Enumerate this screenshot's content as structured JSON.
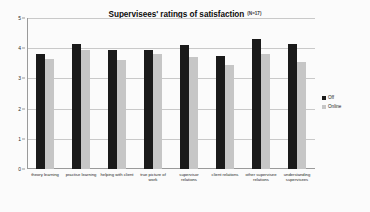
{
  "chart_data": {
    "type": "bar",
    "title": "Supervisees' ratings of satisfaction",
    "title_note": "(N=17)",
    "xlabel": "",
    "ylabel": "",
    "ylim": [
      0,
      5
    ],
    "yticks": [
      0,
      1,
      2,
      3,
      4,
      5
    ],
    "ytick_labels": [
      "0",
      "1",
      "2",
      "3",
      "4",
      "5"
    ],
    "grid": true,
    "legend_position": "right",
    "categories": [
      "theory learning",
      "practise learning",
      "helping with client",
      "true picture of work",
      "supervisor relations",
      "client relations",
      "other supervisee relations",
      "understanding supervisees"
    ],
    "series": [
      {
        "name": "Off",
        "color": "#1a1a1a",
        "values": [
          3.8,
          4.15,
          3.95,
          3.95,
          4.1,
          3.75,
          4.3,
          4.15
        ]
      },
      {
        "name": "Online",
        "color": "#c6c6c6",
        "values": [
          3.65,
          3.95,
          3.6,
          3.8,
          3.7,
          3.45,
          3.8,
          3.55
        ]
      }
    ]
  }
}
